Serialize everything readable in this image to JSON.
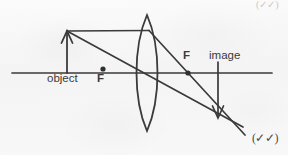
{
  "figure": {
    "kind": "ray-diagram",
    "background_color": "#f7f7f7",
    "ink_color": "#3a3a3a"
  },
  "labels": {
    "object": "object",
    "focal_left": "F",
    "focal_right": "F",
    "image": "image"
  },
  "marks": {
    "checkmarks": "(✓✓)",
    "top_mark": "(✓✓)"
  },
  "geometry": {
    "axis": {
      "x1": 12,
      "y1": 73,
      "x2": 272,
      "y2": 73
    },
    "lens": {
      "center_x": 147,
      "top_y": 15,
      "bottom_y": 131,
      "bulge": 14
    },
    "object_arrow": {
      "x": 67,
      "base_y": 73,
      "tip_y": 31
    },
    "image_arrow": {
      "x": 218,
      "base_y": 73,
      "tip_y": 118
    },
    "focal_point_left": {
      "x": 103,
      "y": 69
    },
    "focal_point_right": {
      "x": 188,
      "y": 73
    },
    "convergence_point": {
      "x": 218,
      "y": 118
    },
    "rays": [
      {
        "name": "parallel-ray-incident",
        "x1": 67,
        "y1": 31,
        "x2": 147,
        "y2": 31
      },
      {
        "name": "parallel-ray-refracted",
        "x1": 147,
        "y1": 31,
        "x2": 245,
        "y2": 135
      },
      {
        "name": "center-ray",
        "x1": 67,
        "y1": 31,
        "x2": 243,
        "y2": 127
      }
    ]
  }
}
